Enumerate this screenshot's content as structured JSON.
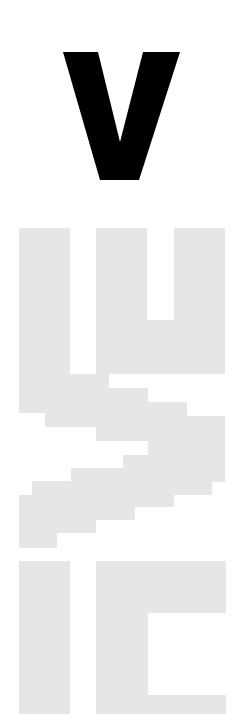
{
  "poster": {
    "headline_letter": "V",
    "colors": {
      "background": "#ffffff",
      "headline": "#000000",
      "pixel_glyphs": "#e6e6e6"
    },
    "headline_shape": {
      "points": "63,52 98,52 120,142 143,52 180,52 139,180 100,180"
    },
    "pixel_glyphs": [
      {
        "name": "glyph-top-u",
        "points": "19,228 70,228 70,374 96,374 96,228 147,228 147,320 174,320 174,228 225,228 225,374 109,374 109,375 109,388 148,388 148,402 187,402 187,416 225,416 225,482 212,482 212,495 174,495 174,507 135,507 135,520 96,520 96,533 57,533 57,548 19,548 19,495 32,495 32,481 71,481 71,468 123,468 123,455 148,455 148,441 96,441 96,427 45,427 45,413 19,413"
      },
      {
        "name": "glyph-bottom-i",
        "points": "19,561 70,561 70,714 19,714"
      },
      {
        "name": "glyph-bottom-c",
        "points": "96,561 226,561 226,613 148,613 148,695 226,695 226,714 96,714"
      }
    ]
  }
}
